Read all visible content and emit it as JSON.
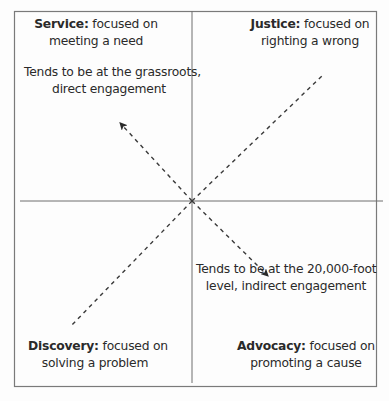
{
  "diagram": {
    "type": "quadrant",
    "quadrants": {
      "top_left": {
        "title": "Service:",
        "line1_rest": " focused on",
        "line2": "meeting a need"
      },
      "top_right": {
        "title": "Justice:",
        "line1_rest": " focused on",
        "line2": "righting a wrong"
      },
      "bottom_left": {
        "title": "Discovery:",
        "line1_rest": " focused on",
        "line2": "solving a problem"
      },
      "bottom_right": {
        "title": "Advocacy:",
        "line1_rest": " focused on",
        "line2": "promoting a cause"
      }
    },
    "axis_annotations": {
      "upper_left": {
        "line1": "Tends to be at the grassroots,",
        "line2": "direct engagement"
      },
      "lower_right": {
        "line1": "Tends to be at the 20,000-foot",
        "line2": "level, indirect engagement"
      }
    },
    "colors": {
      "frame": "#7a7a7a",
      "axes": "#6e6e6e",
      "dashes": "#3a3a3a",
      "text": "#2a2a2a",
      "background": "#fdfdfd"
    }
  }
}
